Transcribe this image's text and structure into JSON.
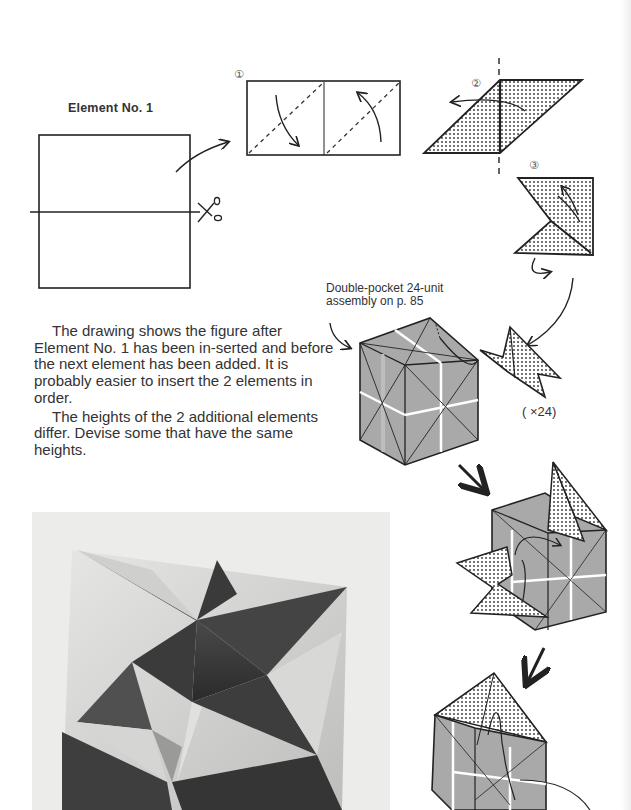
{
  "page": {
    "title": "Element No. 1",
    "steps": [
      {
        "number_glyph": "①",
        "label": "step-1"
      },
      {
        "number_glyph": "②",
        "label": "step-2"
      },
      {
        "number_glyph": "③",
        "label": "step-3"
      }
    ],
    "assembly_caption_line1": "Double-pocket 24-unit",
    "assembly_caption_line2": "assembly on p. 85",
    "multiplier": "( ×24)",
    "paragraphs": [
      "The drawing shows the figure after Element No. 1 has been in-serted and before the next element has been added. It is probably easier to insert the 2 elements in order.",
      "The heights of the 2 additional elements differ. Devise some that have the same heights."
    ]
  },
  "colors": {
    "ink": "#222222",
    "cube_face": "#a9a9a9",
    "paper_dotted": "#ffffff",
    "photo_bg": "#ececea"
  }
}
